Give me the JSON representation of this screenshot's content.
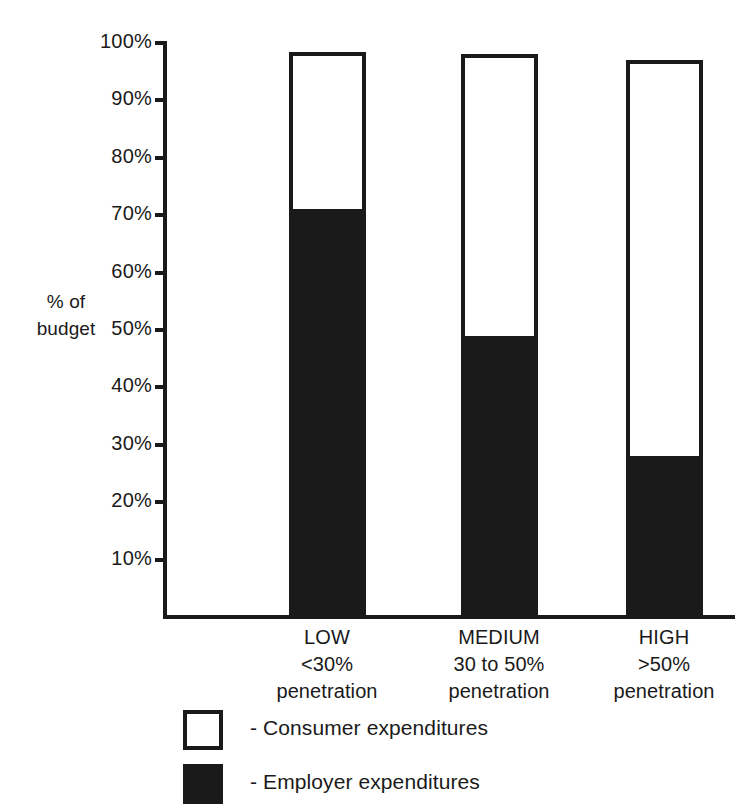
{
  "chart_data": {
    "type": "bar",
    "subtype": "stacked-100",
    "title": "",
    "xlabel": "",
    "ylabel": "% of\nbudget",
    "ylim": [
      0,
      100
    ],
    "ytick_labels": [
      "100%",
      "90%",
      "80%",
      "70%",
      "60%",
      "50%",
      "40%",
      "30%",
      "20%",
      "10%"
    ],
    "ytick_values": [
      100,
      90,
      80,
      70,
      60,
      50,
      40,
      30,
      20,
      10
    ],
    "grid": false,
    "legend_position": "bottom-left",
    "categories": [
      "LOW",
      "MEDIUM",
      "HIGH"
    ],
    "category_lines": [
      [
        "LOW",
        "<30%",
        "penetration"
      ],
      [
        "MEDIUM",
        "30 to 50%",
        "penetration"
      ],
      [
        "HIGH",
        ">50%",
        "penetration"
      ]
    ],
    "series": [
      {
        "name": "Employer expenditures",
        "color": "#1a1a1a",
        "values": [
          71,
          49,
          28
        ]
      },
      {
        "name": "Consumer expenditures",
        "color": "#ffffff",
        "values": [
          27.5,
          49,
          69
        ]
      }
    ],
    "bar_totals": [
      98.5,
      98,
      97
    ]
  },
  "axis": {
    "y_title_line1": "% of",
    "y_title_line2": "budget"
  },
  "legend": {
    "items": [
      {
        "swatch": "hollow",
        "label": "- Consumer expenditures"
      },
      {
        "swatch": "filled",
        "label": "- Employer expenditures"
      }
    ]
  },
  "colors": {
    "ink": "#1a1a1a",
    "paper": "#ffffff"
  }
}
